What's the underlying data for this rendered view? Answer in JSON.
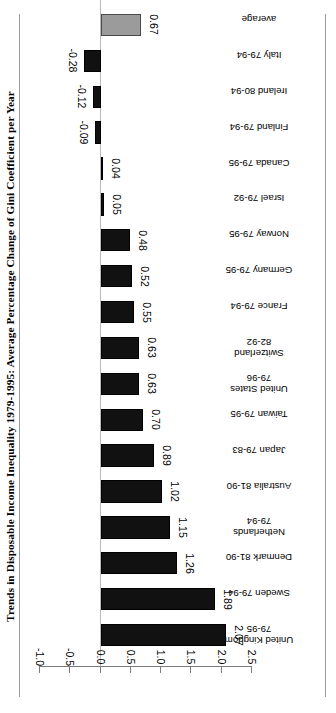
{
  "chart_data": {
    "type": "bar",
    "orientation": "horizontal",
    "title": "Trends in Disposable Income Inequality 1979-1995: Average Percentage Change of Gini Coefficient per Year",
    "xlabel": "",
    "ylabel": "",
    "ylim": [
      2.5,
      -1.0
    ],
    "axis_ticks": [
      "2.5",
      "2.0",
      "1.5",
      "1.0",
      "0.5",
      "0.0",
      "-0.5",
      "-1.0"
    ],
    "axis_tick_values": [
      2.5,
      2.0,
      1.5,
      1.0,
      0.5,
      0.0,
      -0.5,
      -1.0
    ],
    "grid": false,
    "legend": "none",
    "rotated_180": true,
    "bar_color": "#111111",
    "average_bar_color": "#9b9b9b",
    "categories": [
      "United Kingdom\n79-95",
      "Sweden 79-94",
      "Denmark 81-90",
      "Netherlands\n79-94",
      "Australia 81-90",
      "Japan 79-83",
      "Taiwan 79-95",
      "United States\n79-96",
      "Switzerland\n82-92",
      "France 79-94",
      "Germany 79-95",
      "Norway 79-95",
      "Israel 79-92",
      "Canada 79-95",
      "Finland 79-94",
      "Ireland 80-94",
      "Italy 79-94",
      "average"
    ],
    "values": [
      2.07,
      1.89,
      1.26,
      1.15,
      1.02,
      0.89,
      0.7,
      0.63,
      0.63,
      0.55,
      0.52,
      0.48,
      0.05,
      0.04,
      -0.09,
      -0.12,
      -0.28,
      0.67
    ],
    "value_labels": [
      "2.07",
      "1.89",
      "1.26",
      "1.15",
      "1.02",
      "0.89",
      "0.70",
      "0.63",
      "0.63",
      "0.55",
      "0.52",
      "0.48",
      "0.05",
      "0.04",
      "-0.09",
      "-0.12",
      "-0.28",
      "0.67"
    ],
    "average_index": 17
  }
}
